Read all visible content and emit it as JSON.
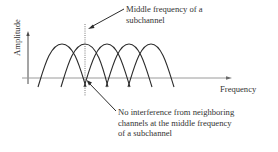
{
  "diagram": {
    "axes": {
      "y_label": "Amplitude",
      "x_label": "Frequency"
    },
    "annotations": {
      "top": {
        "line1": "Middle frequency of a",
        "line2": "subchannel"
      },
      "bottom": {
        "line1": "No interference from neighboring",
        "line2": "channels at the middle frequency",
        "line3": "of a subchannel"
      }
    },
    "subchannels": [
      {
        "peak_x": 62,
        "left_x": 38,
        "right_x": 86
      },
      {
        "peak_x": 85,
        "left_x": 61,
        "right_x": 108
      },
      {
        "peak_x": 107,
        "left_x": 84,
        "right_x": 130
      },
      {
        "peak_x": 129,
        "left_x": 106,
        "right_x": 152
      },
      {
        "peak_x": 151,
        "left_x": 128,
        "right_x": 174
      }
    ],
    "colors": {
      "curve": "#2b2b2b",
      "axis": "#9a9a9a",
      "text": "#333333"
    }
  }
}
